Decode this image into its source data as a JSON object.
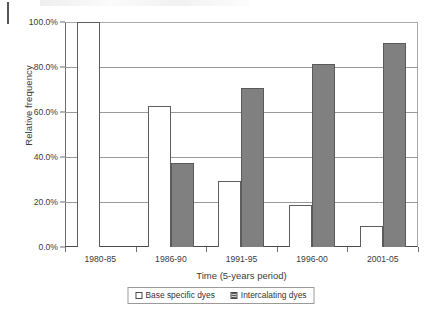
{
  "chart_data": {
    "type": "bar",
    "title": "",
    "xlabel": "Time (5-years period)",
    "ylabel": "Relative frequency",
    "categories": [
      "1980-85",
      "1986-90",
      "1991-95",
      "1996-00",
      "2001-05"
    ],
    "series": [
      {
        "name": "Base specific dyes",
        "values": [
          100.0,
          62.5,
          29.5,
          18.5,
          9.5
        ],
        "color": "#ffffff"
      },
      {
        "name": "Intercalating dyes",
        "values": [
          0.0,
          37.5,
          70.5,
          81.5,
          90.5
        ],
        "color": "#808080"
      }
    ],
    "ylim": [
      0,
      100
    ],
    "yticks": [
      "0.0%",
      "20.0%",
      "40.0%",
      "60.0%",
      "80.0%",
      "100.0%"
    ],
    "ytick_values": [
      0,
      20,
      40,
      60,
      80,
      100
    ],
    "y_unit": "%",
    "grid": true,
    "legend_position": "bottom"
  },
  "legend": {
    "items": [
      {
        "label": "Base specific dyes",
        "swatch": "open-square-swatch"
      },
      {
        "label": "Intercalating dyes",
        "swatch": "hatched-square-swatch"
      }
    ]
  }
}
